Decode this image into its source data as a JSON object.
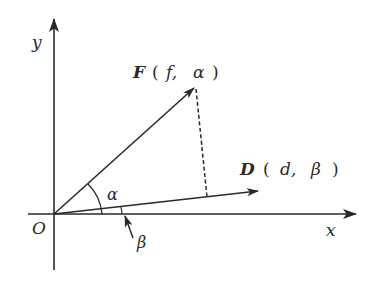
{
  "diagram": {
    "type": "vector-coordinate-diagram",
    "colors": {
      "line": "#2a2a2a",
      "background": "#ffffff"
    },
    "axes": {
      "x_label": "x",
      "y_label": "y",
      "origin_label": "O"
    },
    "vectors": [
      {
        "name": "F",
        "magnitude": "f",
        "angle": "α",
        "label_name": "F",
        "label_open": "(",
        "label_mag": "f,",
        "label_angle": "α",
        "label_close": ")"
      },
      {
        "name": "D",
        "magnitude": "d",
        "angle": "β",
        "label_name": "D",
        "label_open": "(",
        "label_mag": "d,",
        "label_angle": "β",
        "label_close": ")"
      }
    ],
    "angles": {
      "alpha": "α",
      "beta": "β"
    },
    "projection": "dashed perpendicular from F tip to D"
  }
}
